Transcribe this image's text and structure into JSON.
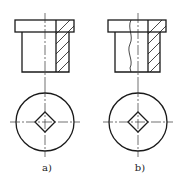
{
  "figure": {
    "views": [
      {
        "id": "a",
        "label": "a)",
        "section_style": "full-half-section"
      },
      {
        "id": "b",
        "label": "b)",
        "section_style": "local-section-with-break-line"
      }
    ]
  },
  "colors": {
    "line": "#1a1a1a",
    "centerline": "#333333",
    "background": "#ffffff"
  }
}
